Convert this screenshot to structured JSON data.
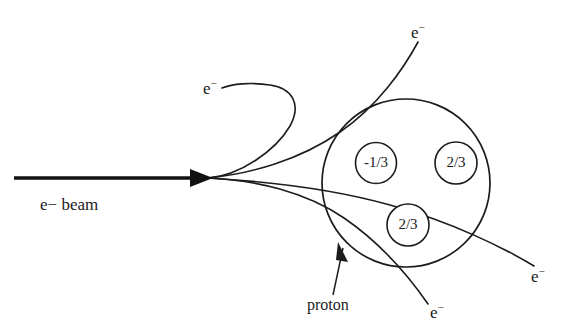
{
  "figure": {
    "type": "physics-diagram",
    "background_color": "#ffffff",
    "ink_color": "#1c1c1c"
  },
  "beam": {
    "label_particle": "e",
    "label_charge": "−",
    "label_text": " beam",
    "direction": "left-to-right"
  },
  "proton": {
    "annotation_label": "proton",
    "quarks": [
      {
        "id": "down-quark",
        "charge": "-1/3"
      },
      {
        "id": "up-quark-right",
        "charge": "2/3"
      },
      {
        "id": "up-quark-bottom",
        "charge": "2/3"
      }
    ]
  },
  "scattered_electrons": [
    {
      "id": "electron-backscatter",
      "particle": "e",
      "charge": "−",
      "position": "upper-left"
    },
    {
      "id": "electron-forward-up",
      "particle": "e",
      "charge": "−",
      "position": "top-right"
    },
    {
      "id": "electron-forward-right",
      "particle": "e",
      "charge": "−",
      "position": "lower-right"
    },
    {
      "id": "electron-forward-down",
      "particle": "e",
      "charge": "−",
      "position": "bottom"
    }
  ]
}
